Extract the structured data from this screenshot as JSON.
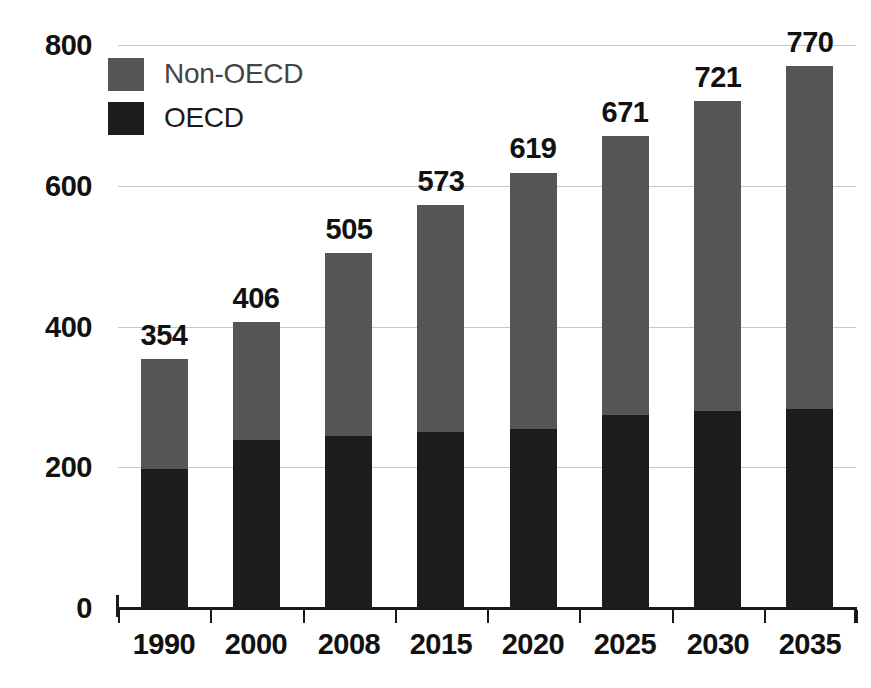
{
  "chart_data": {
    "type": "bar",
    "subtype": "stacked-vertical",
    "title": "",
    "subtitle": "",
    "xlabel": "",
    "ylabel": "",
    "categories": [
      "1990",
      "2000",
      "2008",
      "2015",
      "2020",
      "2025",
      "2030",
      "2035"
    ],
    "series": [
      {
        "name": "OECD",
        "color": "#1c1c1c",
        "values": [
          197,
          239,
          245,
          250,
          255,
          274,
          280,
          283
        ]
      },
      {
        "name": "Non-OECD",
        "color": "#555555",
        "values": [
          157,
          167,
          260,
          323,
          364,
          397,
          441,
          487
        ]
      }
    ],
    "totals": [
      354,
      406,
      505,
      573,
      619,
      671,
      721,
      770
    ],
    "data_labels": [
      "354",
      "406",
      "505",
      "573",
      "619",
      "671",
      "721",
      "770"
    ],
    "ylim": [
      0,
      800
    ],
    "yticks": [
      0,
      200,
      400,
      600,
      800
    ],
    "ytick_labels": [
      "0",
      "200",
      "400",
      "600",
      "800"
    ],
    "grid": true,
    "grid_axis": "y",
    "legend_position": "top-left",
    "legend": [
      "Non-OECD",
      "OECD"
    ],
    "stack_order_bottom_to_top": [
      "OECD",
      "Non-OECD"
    ]
  },
  "legend": {
    "items": [
      {
        "label": "Non-OECD",
        "swatch": "#555555"
      },
      {
        "label": "OECD",
        "swatch": "#1c1c1c"
      }
    ]
  },
  "colors": {
    "oecd": "#1c1c1c",
    "non_oecd": "#555555",
    "gridline": "#c8c8c8",
    "axis": "#1a1a1a",
    "background": "#ffffff",
    "text": "#111111"
  }
}
